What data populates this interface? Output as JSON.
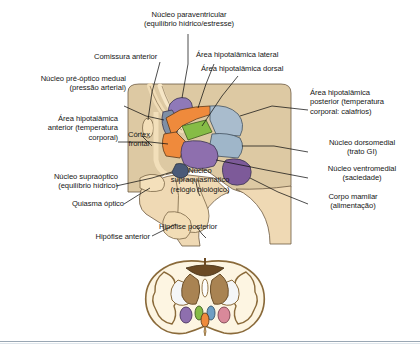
{
  "figure": {
    "title_semantic": "hypothalamus-sagittal-diagram",
    "colors": {
      "brain_tan": "#ddc9a3",
      "tract_cream": "#f6e3c0",
      "paraventricular_purple": "#8f79b8",
      "preoptic_slate": "#7f8fa6",
      "lateral_orange": "#ef8a3c",
      "dorsal_green": "#86bc46",
      "posterior_bluegray": "#a9bccd",
      "dorsomedial_blue": "#9fb6c9",
      "ventromedial_violet": "#8e6fae",
      "mamillary_purple": "#7d5a99",
      "supraoptic_dark": "#4a5a78",
      "leader_line": "#111111",
      "rule": "#9aa7b4"
    }
  },
  "labels": {
    "paraventricular": "Núcleo paraventricular\n(equilíbrio hídrico/estresse)",
    "lateral_area": "Área hipotalâmica lateral",
    "anterior_commissure": "Comissura anterior",
    "dorsal_area": "Área hipotalâmica dorsal",
    "medial_preoptic": "Núcleo pré-óptico medual\n(pressão arterial)",
    "posterior_area": "Área hipotalâmica\nposterior (temperatura\ncorporal: calafrios)",
    "anterior_area": "Área hipotalâmica\nanterior (temperatura\ncorporal)",
    "frontal_cortex": "Córtex\nfrontal",
    "dorsomedial": "Núcleo dorsomedial\n(trato GI)",
    "supraoptic": "Núcleo supraóptico\n(equilíbrio hídrico)",
    "suprachiasmatic": "Núcleo\nsupraquiasmático\n(relógio biológico)",
    "ventromedial": "Núcleo ventromedial\n(saciedade)",
    "optic_chiasm": "Quiasma óptico",
    "mamillary_body": "Corpo mamilar\n(alimentação)",
    "posterior_pituitary": "Hipófise posterior",
    "anterior_pituitary": "Hipófise anterior"
  }
}
